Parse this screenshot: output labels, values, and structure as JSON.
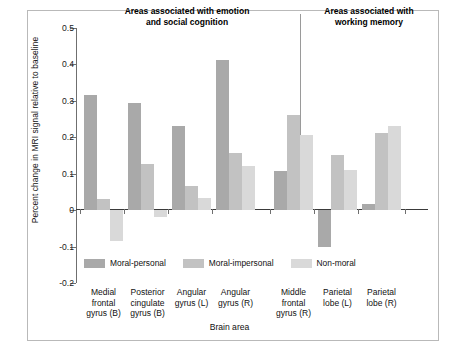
{
  "chart_data": {
    "type": "bar",
    "title": "",
    "xlabel": "Brain area",
    "ylabel": "Percent change in MRI signal relative to baseline",
    "ylim": [
      -0.2,
      0.5
    ],
    "yticks": [
      0.5,
      0.4,
      0.3,
      0.2,
      0.1,
      0,
      -0.1,
      -0.2
    ],
    "ytick_labels": [
      "0.5",
      "0.4",
      "0.3",
      "0.2",
      "0.1",
      "0",
      "-0.1",
      "-0.2"
    ],
    "grid": false,
    "legend_position": "bottom-left",
    "categories": [
      "Medial frontal gyrus (B)",
      "Posterior cingulate gyrus (B)",
      "Angular gyrus (L)",
      "Angular gyrus (R)",
      "Middle frontal gyrus (R)",
      "Parietal lobe (L)",
      "Parietal lobe (R)"
    ],
    "series": [
      {
        "name": "Moral-personal",
        "color": "#a9a9a9",
        "values": [
          0.315,
          0.295,
          0.23,
          0.412,
          0.107,
          -0.102,
          0.018
        ]
      },
      {
        "name": "Moral-impersonal",
        "color": "#c2c2c2",
        "values": [
          0.03,
          0.128,
          0.065,
          0.157,
          0.262,
          0.152,
          0.213
        ]
      },
      {
        "name": "Non-moral",
        "color": "#d9d9d9",
        "values": [
          -0.085,
          -0.02,
          0.033,
          0.122,
          0.205,
          0.11,
          0.232
        ]
      }
    ],
    "annotations": [
      {
        "text": "Areas associated with emotion and social cognition",
        "covers": [
          0,
          1,
          2,
          3
        ]
      },
      {
        "text": "Areas associated with working memory",
        "covers": [
          4,
          5,
          6
        ]
      }
    ]
  },
  "headers": {
    "left": "Areas associated with emotion\nand social cognition",
    "left_line1": "Areas associated with emotion",
    "left_line2": "and social cognition",
    "right_line1": "Areas associated with",
    "right_line2": "working memory"
  },
  "xcats": [
    {
      "l1": "Medial",
      "l2": "frontal",
      "l3": "gyrus (B)"
    },
    {
      "l1": "Posterior",
      "l2": "cingulate",
      "l3": "gyrus (B)"
    },
    {
      "l1": "Angular",
      "l2": "gyrus (L)",
      "l3": ""
    },
    {
      "l1": "Angular",
      "l2": "gyrus (R)",
      "l3": ""
    },
    {
      "l1": "Middle",
      "l2": "frontal",
      "l3": "gyrus (R)"
    },
    {
      "l1": "Parietal",
      "l2": "lobe (L)",
      "l3": ""
    },
    {
      "l1": "Parietal",
      "l2": "lobe (R)",
      "l3": ""
    }
  ]
}
